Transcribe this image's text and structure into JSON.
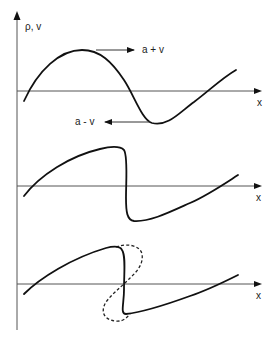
{
  "diagram": {
    "y_axis_label": "ρ, v",
    "panels": [
      {
        "id": "initial",
        "x_axis_label": "x",
        "description": "Smooth initial wave profile",
        "annotations": [
          {
            "label": "a + v",
            "direction": "right",
            "meaning": "crest moves right at speed a + v"
          },
          {
            "label": "a - v",
            "direction": "left",
            "meaning": "trough moves left relative at speed a - v"
          }
        ]
      },
      {
        "id": "steepened",
        "x_axis_label": "x",
        "description": "Wave front steepens to vertical"
      },
      {
        "id": "overturned",
        "x_axis_label": "x",
        "description": "Shock: multivalued (dashed) solution replaced by discontinuity"
      }
    ]
  }
}
